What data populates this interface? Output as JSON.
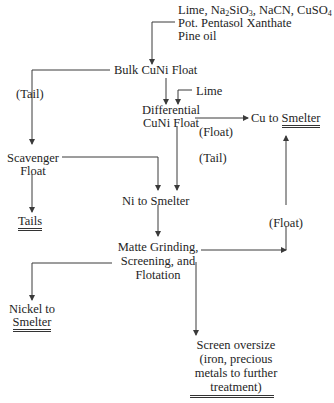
{
  "diagram": {
    "reagents": {
      "line1_prefix": "Lime, Na",
      "line1_sub1": "2",
      "line1_mid": "SiO",
      "line1_sub2": "3",
      "line1_suffix": ", NaCN, CuSO",
      "line1_sub3": "4",
      "line2": "Pot. Pentasol Xanthate",
      "line3": "Pine oil"
    },
    "nodes": {
      "bulk_float": "Bulk CuNi Float",
      "tail_label_1": "(Tail)",
      "lime": "Lime",
      "diff_float_1": "Differential",
      "diff_float_2": "CuNi Float",
      "cu_to": "Cu to ",
      "cu_smelter": "Smelter",
      "float_label_1": "(Float)",
      "tail_label_2": "(Tail)",
      "scavenger_1": "Scavenger",
      "scavenger_2": "Float",
      "tails": "Tails",
      "ni_to_smelter": "Ni to Smelter",
      "float_label_2": "(Float)",
      "matte_1": "Matte Grinding,",
      "matte_2": "Screening, and",
      "matte_3": "Flotation",
      "nickel_1": "Nickel to",
      "nickel_2": "Smelter",
      "oversize_1": "Screen oversize",
      "oversize_2": "(iron, precious",
      "oversize_3": "metals to further",
      "oversize_4": "treatment)"
    },
    "colors": {
      "line": "#3a3a3a",
      "text": "#1e1e1e"
    }
  }
}
